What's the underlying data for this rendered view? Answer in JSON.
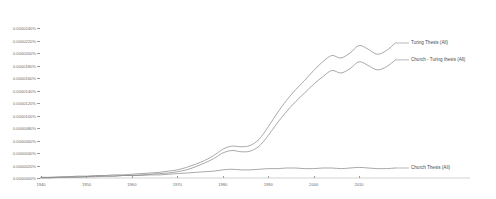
{
  "chart_data": {
    "type": "line",
    "title": "",
    "xlabel": "",
    "ylabel": "",
    "grid": false,
    "legend_position": "right-inline",
    "xlim": [
      1940,
      2019
    ],
    "ylim": [
      0.0,
      2.4e-05
    ],
    "x_ticks": [
      "1940",
      "1950",
      "1960",
      "1970",
      "1980",
      "1990",
      "2000",
      "2010"
    ],
    "x_tick_values": [
      1940,
      1950,
      1960,
      1970,
      1980,
      1990,
      2000,
      2010
    ],
    "y_ticks": [
      "0.0000240%",
      "0.0000220%",
      "0.0000200%",
      "0.0000180%",
      "0.0000160%",
      "0.0000140%",
      "0.0000120%",
      "0.0000100%",
      "0.0000080%",
      "0.0000060%",
      "0.0000040%",
      "0.0000020%",
      "0.0000000%"
    ],
    "y_tick_values": [
      2.4e-05,
      2.2e-05,
      2e-05,
      1.8e-05,
      1.6e-05,
      1.4e-05,
      1.2e-05,
      1e-05,
      8e-06,
      6e-06,
      4e-06,
      2e-06,
      0.0
    ],
    "x": [
      1940,
      1942,
      1944,
      1946,
      1948,
      1950,
      1952,
      1954,
      1956,
      1958,
      1960,
      1962,
      1964,
      1966,
      1968,
      1970,
      1972,
      1974,
      1976,
      1978,
      1980,
      1982,
      1984,
      1986,
      1988,
      1990,
      1992,
      1994,
      1996,
      1998,
      2000,
      2002,
      2004,
      2006,
      2008,
      2010,
      2012,
      2014,
      2016,
      2018
    ],
    "series": [
      {
        "name": "Turing Thesis (All)",
        "color": "#8c8c8c",
        "values": [
          1e-07,
          1e-07,
          2e-07,
          2e-07,
          3e-07,
          3e-07,
          4e-07,
          4e-07,
          5e-07,
          5e-07,
          6e-07,
          7e-07,
          8e-07,
          9e-07,
          1.1e-06,
          1.3e-06,
          1.7e-06,
          2.2e-06,
          2.8e-06,
          3.6e-06,
          4.6e-06,
          5.1e-06,
          5e-06,
          5.2e-06,
          6.2e-06,
          8.2e-06,
          1.04e-05,
          1.24e-05,
          1.41e-05,
          1.56e-05,
          1.72e-05,
          1.86e-05,
          1.96e-05,
          1.92e-05,
          2e-05,
          2.12e-05,
          2.06e-05,
          1.98e-05,
          2.04e-05,
          2.16e-05
        ]
      },
      {
        "name": "Church - Turing thesis (All)",
        "color": "#8c8c8c",
        "values": [
          0.0,
          0.0,
          1e-07,
          1e-07,
          1e-07,
          2e-07,
          2e-07,
          3e-07,
          3e-07,
          4e-07,
          4e-07,
          5e-07,
          6e-07,
          7e-07,
          8e-07,
          1e-06,
          1.3e-06,
          1.8e-06,
          2.4e-06,
          3.1e-06,
          4e-06,
          4.4e-06,
          4.2e-06,
          4.3e-06,
          5.1e-06,
          6.8e-06,
          8.8e-06,
          1.06e-05,
          1.22e-05,
          1.36e-05,
          1.5e-05,
          1.62e-05,
          1.72e-05,
          1.68e-05,
          1.75e-05,
          1.86e-05,
          1.8e-05,
          1.73e-05,
          1.78e-05,
          1.89e-05
        ]
      },
      {
        "name": "Church Thesis (All)",
        "color": "#8c8c8c",
        "values": [
          1e-07,
          1e-07,
          1e-07,
          2e-07,
          2e-07,
          2e-07,
          3e-07,
          3e-07,
          3e-07,
          4e-07,
          4e-07,
          4e-07,
          5e-07,
          5e-07,
          6e-07,
          7e-07,
          8e-07,
          9e-07,
          1e-06,
          1.1e-06,
          1.3e-06,
          1.4e-06,
          1.3e-06,
          1.3e-06,
          1.4e-06,
          1.5e-06,
          1.5e-06,
          1.6e-06,
          1.6e-06,
          1.5e-06,
          1.5e-06,
          1.6e-06,
          1.6e-06,
          1.5e-06,
          1.6e-06,
          1.7e-06,
          1.6e-06,
          1.5e-06,
          1.5e-06,
          1.6e-06
        ]
      }
    ],
    "legend": [
      {
        "label": "Turing Thesis (All)"
      },
      {
        "label": "Church - Turing thesis (All)"
      },
      {
        "label": "Church Thesis (All)"
      }
    ]
  }
}
